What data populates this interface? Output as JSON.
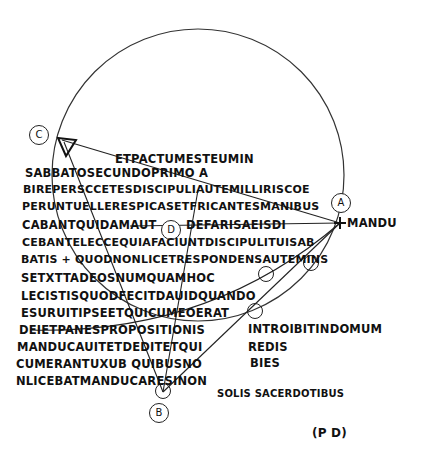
{
  "figure": {
    "labels": {
      "A": "A",
      "B": "B",
      "C": "C",
      "D": "D"
    },
    "monogram": "(P D)"
  },
  "text_lines": [
    "ETPACTUMESTEUMIN",
    "SABBATOSECUNDOPRIMO A",
    "BIREPERSCCETESDISCIPULIAUTEMILLIRISCOE",
    "PERUNTUELLERESPICASETFRICANTESMANIBUS",
    "CABANTQUIDAMAUT",
    "DEFARISAEISDI",
    "CEBANTELECCEQUIAFACIUNTDISCIPULITUISAB",
    "BATIS + QUODNONLICETRESPONDENSAUTEMINS",
    "SETXTTADEOSNUMQUAMHOC",
    "LECISTISQUODFECITDAUIDQUANDO",
    "ESURUITIPSEETQUICUMEOERAT",
    "DEIETPANESPROPOSITIONIS",
    "MANDUCAUITETDEDITETQUI",
    "CUMERANTUXUB QUIBUSNO",
    "NLICEBATMANDUCARESINON",
    "MANDU",
    "INTROIBITINDOMUM",
    "REDIS",
    "BIES",
    "SOLIS SACERDOTIBUS"
  ]
}
